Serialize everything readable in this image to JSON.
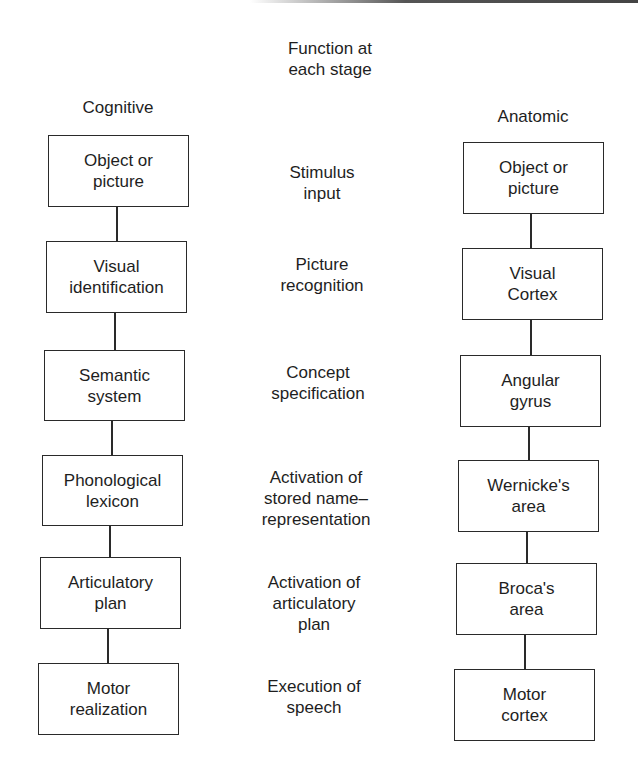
{
  "header": {
    "function_title": "Function at\neach stage",
    "left_column_title": "Cognitive",
    "right_column_title": "Anatomic"
  },
  "stages": [
    {
      "cognitive": "Object or\npicture",
      "function": "Stimulus\ninput",
      "anatomic": "Object or\npicture"
    },
    {
      "cognitive": "Visual\nidentification",
      "function": "Picture\nrecognition",
      "anatomic": "Visual\nCortex"
    },
    {
      "cognitive": "Semantic\nsystem",
      "function": "Concept\nspecification",
      "anatomic": "Angular\ngyrus"
    },
    {
      "cognitive": "Phonological\nlexicon",
      "function": "Activation of\nstored name–\nrepresentation",
      "anatomic": "Wernicke's\narea"
    },
    {
      "cognitive": "Articulatory\nplan",
      "function": "Activation of\narticulatory\nplan",
      "anatomic": "Broca's\narea"
    },
    {
      "cognitive": "Motor\nrealization",
      "function": "Execution of\nspeech",
      "anatomic": "Motor\ncortex"
    }
  ],
  "colors": {
    "line": "#2a2a2a",
    "text": "#1e1e1e",
    "background": "#ffffff"
  }
}
